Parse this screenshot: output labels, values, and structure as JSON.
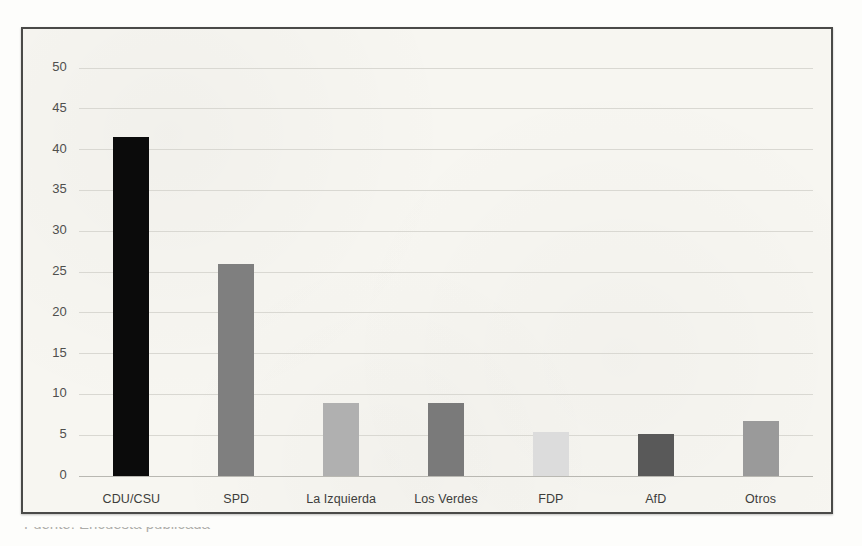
{
  "figure": {
    "frame_color": "#4a4a48",
    "paper_color": "#f7f6f1"
  },
  "caption": {
    "text": "Fuente: Encuesta publicada"
  },
  "chart_data": {
    "type": "bar",
    "title": "",
    "subtitle": "",
    "xlabel": "",
    "ylabel": "",
    "categories": [
      "CDU/CSU",
      "SPD",
      "La Izquierda",
      "Los Verdes",
      "FDP",
      "AfD",
      "Otros"
    ],
    "values": [
      41.6,
      26.0,
      9.0,
      8.9,
      5.4,
      5.2,
      6.8
    ],
    "colors": [
      "#0b0b0b",
      "#7f7f7f",
      "#b0b0b0",
      "#7a7a7a",
      "#dcdcdc",
      "#595959",
      "#9a9a9a"
    ],
    "ylim": [
      0,
      50
    ],
    "yticks": [
      0,
      5,
      10,
      15,
      20,
      25,
      30,
      35,
      40,
      45,
      50
    ],
    "ytick_labels": [
      "0",
      "5",
      "10",
      "15",
      "20",
      "25",
      "30",
      "35",
      "40",
      "45",
      "50"
    ],
    "grid": true,
    "grid_axis": "y",
    "legend": false,
    "legend_position": "none"
  }
}
